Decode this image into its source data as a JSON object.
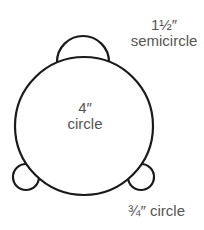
{
  "diagram": {
    "colors": {
      "stroke": "#1a1a1a",
      "fill": "#ffffff",
      "text": "#555555"
    },
    "shapes": {
      "semicircle": {
        "cx": 83,
        "cy": 62,
        "r": 26
      },
      "main_circle": {
        "cx": 84,
        "cy": 126,
        "r": 69
      },
      "small_circle_left": {
        "cx": 26,
        "cy": 177,
        "r": 13
      },
      "small_circle_right": {
        "cx": 141,
        "cy": 177,
        "r": 13
      }
    },
    "labels": {
      "semicircle": {
        "size": "1½″",
        "name": "semicircle"
      },
      "main_circle": {
        "size": "4″",
        "name": "circle"
      },
      "small_circle": {
        "text": "¾″ circle"
      }
    }
  }
}
